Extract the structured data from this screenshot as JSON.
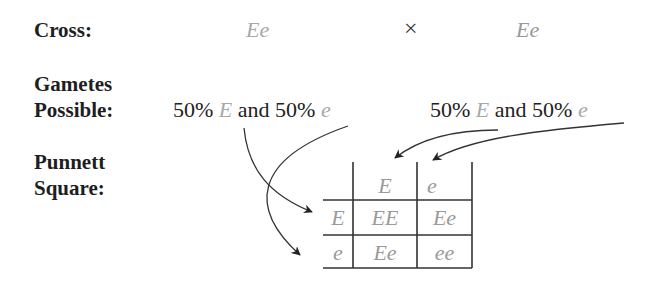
{
  "labels": {
    "cross": "Cross:",
    "gametes_line1": "Gametes",
    "gametes_line2": "Possible:",
    "punnett_line1": "Punnett",
    "punnett_line2": "Square:"
  },
  "cross": {
    "parent1": "Ee",
    "symbol": "×",
    "parent2": "Ee"
  },
  "gametes": {
    "parent1": {
      "pct1": "50%",
      "allele1": "E",
      "and": "and",
      "pct2": "50%",
      "allele2": "e"
    },
    "parent2": {
      "pct1": "50%",
      "allele1": "E",
      "and": "and",
      "pct2": "50%",
      "allele2": "e"
    }
  },
  "punnett": {
    "col_headers": [
      "E",
      "e"
    ],
    "row_headers": [
      "E",
      "e"
    ],
    "cells": [
      [
        "EE",
        "Ee"
      ],
      [
        "Ee",
        "ee"
      ]
    ]
  },
  "colors": {
    "allele_gray": "#a8a8a8",
    "line": "#333333"
  }
}
